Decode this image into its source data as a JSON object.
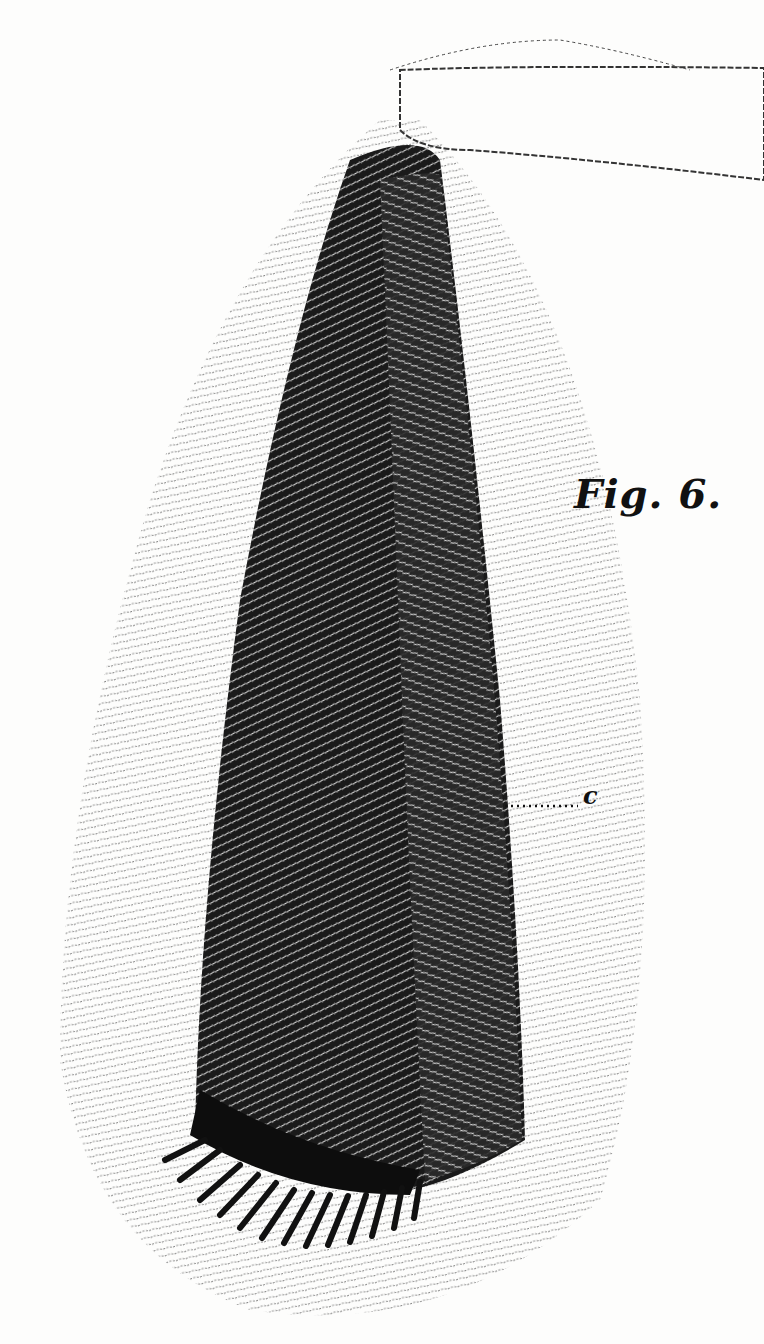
{
  "figure": {
    "title": "Fig. 6.",
    "labels": [
      {
        "id": "c",
        "text": "c",
        "x": 583,
        "y": 800,
        "leader_from": [
          505,
          806
        ]
      }
    ]
  },
  "colors": {
    "ink": "#111111",
    "paper": "#fdfdfc",
    "hair": "#3a3a3a"
  }
}
